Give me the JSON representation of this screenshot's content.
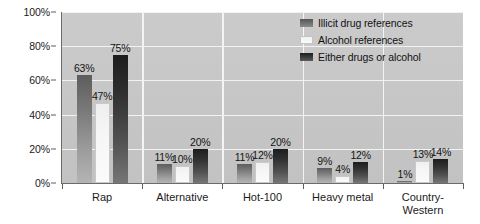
{
  "chart_data": {
    "type": "bar",
    "title": "",
    "xlabel": "",
    "ylabel": "",
    "ylim": [
      0,
      100
    ],
    "grid": true,
    "legend_position": "top-right",
    "categories": [
      "Rap",
      "Alternative",
      "Hot-100",
      "Heavy metal",
      "Country-\nWestern"
    ],
    "ytick_labels": [
      "0%",
      "20%",
      "40%",
      "60%",
      "80%",
      "100%"
    ],
    "ytick_values": [
      0,
      20,
      40,
      60,
      80,
      100
    ],
    "series": [
      {
        "name": "Illicit drug references",
        "color": "#7b7b7b",
        "values": [
          63,
          11,
          11,
          9,
          1
        ],
        "labels": [
          "63%",
          "11%",
          "11%",
          "9%",
          "1%"
        ]
      },
      {
        "name": "Alcohol references",
        "color": "#f6f6f6",
        "values": [
          47,
          10,
          12,
          4,
          13
        ],
        "labels": [
          "47%",
          "10%",
          "12%",
          "4%",
          "13%"
        ]
      },
      {
        "name": "Either drugs or alcohol",
        "color": "#303030",
        "values": [
          75,
          20,
          20,
          12,
          14
        ],
        "labels": [
          "75%",
          "20%",
          "20%",
          "12%",
          "14%"
        ]
      }
    ]
  },
  "legend": {
    "items": [
      {
        "label": "Illicit drug references"
      },
      {
        "label": "Alcohol references"
      },
      {
        "label": "Either drugs or alcohol"
      }
    ]
  },
  "colors": {
    "plot_background": "#c6c6c6",
    "gridline": "#f2f2f2",
    "axis": "#6b6b6b",
    "text": "#141414"
  }
}
